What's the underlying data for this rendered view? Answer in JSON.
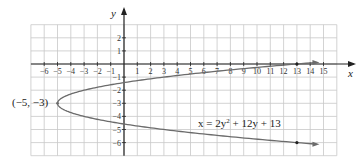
{
  "chart_data": {
    "type": "line",
    "title": "",
    "xlabel": "x",
    "ylabel": "y",
    "xlim": [
      -7,
      16
    ],
    "ylim": [
      -7,
      3
    ],
    "grid": true,
    "x_ticks": [
      -6,
      -5,
      -4,
      -3,
      -2,
      -1,
      1,
      2,
      3,
      4,
      5,
      6,
      7,
      8,
      9,
      10,
      11,
      12,
      13,
      14,
      15
    ],
    "y_ticks": [
      2,
      1,
      -1,
      -2,
      -3,
      -4,
      -5,
      -6
    ],
    "x_tick_labels": [
      "−6",
      "−5",
      "−4",
      "−3",
      "−2",
      "−1",
      "1",
      "2",
      "3",
      "4",
      "5",
      "6",
      "7",
      "8",
      "9",
      "10",
      "11",
      "12",
      "13",
      "14",
      "15"
    ],
    "y_tick_labels": [
      "2",
      "1",
      "−1",
      "−2",
      "−3",
      "−4",
      "−5",
      "−6"
    ],
    "series": [
      {
        "name": "x = 2y² + 12y + 13",
        "equation": "x = 2y^2 + 12y + 13",
        "orientation": "horizontal parabola opening right",
        "vertex": [
          -5,
          -3
        ],
        "points": [
          [
            13,
            0
          ],
          [
            13,
            -6
          ],
          [
            -5,
            -3
          ],
          [
            15.5,
            0.1
          ],
          [
            15.5,
            -6.1
          ]
        ],
        "marked_points": [
          [
            13,
            0
          ],
          [
            13,
            -6
          ]
        ]
      }
    ],
    "annotations": [
      {
        "text": "(−5, −3)",
        "at": [
          -5,
          -3
        ]
      },
      {
        "text": "x = 2y² + 12y + 13",
        "at": [
          7.5,
          -4.5
        ]
      }
    ]
  },
  "labels": {
    "x_axis": "x",
    "y_axis": "y",
    "vertex": "(−5, −3)",
    "equation_prefix": "x = 2y",
    "equation_exp": "2",
    "equation_suffix": " + 12y + 13"
  },
  "colors": {
    "grid": "#c8c8c8",
    "axis": "#222222",
    "curve": "#6b6b6b",
    "text": "#222222"
  }
}
